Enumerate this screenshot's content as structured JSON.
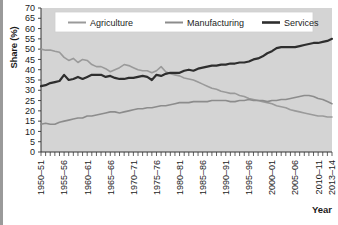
{
  "chart_data": {
    "type": "line",
    "title": "",
    "xlabel": "Year",
    "ylabel": "Share (%)",
    "ylim": [
      0,
      70
    ],
    "ytick_step": 5,
    "yticks": [
      0,
      5,
      10,
      15,
      20,
      25,
      30,
      35,
      40,
      45,
      50,
      55,
      60,
      65,
      70
    ],
    "grid": false,
    "legend_position": "top-center",
    "x_tick_labels": [
      "1950–51",
      "1955–56",
      "1960–61",
      "1965–66",
      "1970–71",
      "1975–76",
      "1980–81",
      "1985–86",
      "1990–91",
      "1995–96",
      "2000–01",
      "2005–06",
      "2010–11",
      "2013–14"
    ],
    "x_tick_index": [
      0,
      5,
      10,
      15,
      20,
      25,
      30,
      35,
      40,
      45,
      50,
      55,
      60,
      63
    ],
    "x": [
      "1950-51",
      "1951-52",
      "1952-53",
      "1953-54",
      "1954-55",
      "1955-56",
      "1956-57",
      "1957-58",
      "1958-59",
      "1959-60",
      "1960-61",
      "1961-62",
      "1962-63",
      "1963-64",
      "1964-65",
      "1965-66",
      "1966-67",
      "1967-68",
      "1968-69",
      "1969-70",
      "1970-71",
      "1971-72",
      "1972-73",
      "1973-74",
      "1974-75",
      "1975-76",
      "1976-77",
      "1977-78",
      "1978-79",
      "1979-80",
      "1980-81",
      "1981-82",
      "1982-83",
      "1983-84",
      "1984-85",
      "1985-86",
      "1986-87",
      "1987-88",
      "1988-89",
      "1989-90",
      "1990-91",
      "1991-92",
      "1992-93",
      "1993-94",
      "1994-95",
      "1995-96",
      "1996-97",
      "1997-98",
      "1998-99",
      "1999-00",
      "2000-01",
      "2001-02",
      "2002-03",
      "2003-04",
      "2004-05",
      "2005-06",
      "2006-07",
      "2007-08",
      "2008-09",
      "2009-10",
      "2010-11",
      "2011-12",
      "2012-13",
      "2013-14"
    ],
    "series": [
      {
        "name": "Agriculture",
        "color": "#9a9a9a",
        "width": 1.6,
        "values": [
          50.0,
          49.5,
          49.6,
          49.0,
          48.5,
          46.0,
          44.5,
          45.5,
          43.5,
          45.0,
          44.5,
          42.5,
          41.5,
          41.5,
          40.5,
          39.0,
          40.0,
          41.0,
          42.5,
          42.0,
          41.0,
          40.0,
          39.5,
          39.5,
          38.5,
          39.5,
          41.5,
          39.0,
          38.0,
          37.5,
          37.0,
          36.0,
          35.5,
          35.0,
          34.0,
          33.0,
          32.0,
          31.0,
          30.5,
          29.5,
          29.0,
          28.5,
          28.5,
          27.5,
          27.0,
          26.0,
          25.5,
          25.0,
          24.5,
          24.0,
          23.5,
          22.5,
          22.0,
          21.5,
          20.5,
          20.0,
          19.5,
          19.0,
          18.5,
          18.0,
          17.5,
          17.5,
          17.0,
          17.0
        ]
      },
      {
        "name": "Manufacturing",
        "color": "#8c8c8c",
        "width": 1.6,
        "values": [
          13.5,
          14.0,
          13.5,
          13.5,
          14.5,
          15.0,
          15.5,
          16.0,
          16.5,
          16.5,
          17.5,
          17.5,
          18.0,
          18.5,
          19.0,
          19.5,
          19.5,
          19.0,
          19.5,
          20.0,
          20.5,
          21.0,
          21.0,
          21.5,
          21.5,
          22.0,
          22.5,
          22.5,
          23.0,
          23.5,
          24.0,
          24.0,
          24.0,
          24.5,
          24.5,
          24.5,
          24.5,
          25.0,
          25.0,
          25.0,
          25.0,
          24.5,
          24.5,
          25.0,
          25.0,
          25.5,
          25.0,
          25.0,
          25.0,
          24.5,
          25.0,
          25.0,
          25.5,
          25.5,
          26.0,
          26.5,
          27.0,
          27.5,
          27.5,
          27.0,
          26.0,
          25.5,
          24.5,
          23.5
        ]
      },
      {
        "name": "Services",
        "color": "#2e2e2e",
        "width": 2.2,
        "values": [
          32.0,
          32.5,
          33.5,
          34.0,
          34.5,
          37.5,
          35.0,
          35.5,
          36.5,
          35.5,
          36.5,
          37.5,
          37.5,
          37.5,
          36.5,
          37.0,
          36.0,
          35.5,
          35.5,
          36.0,
          36.0,
          36.5,
          37.0,
          36.5,
          35.0,
          37.5,
          37.0,
          38.0,
          38.5,
          38.5,
          38.5,
          39.5,
          40.0,
          39.5,
          40.5,
          41.0,
          41.5,
          42.0,
          42.0,
          42.5,
          42.5,
          43.0,
          43.0,
          43.5,
          43.5,
          44.0,
          45.0,
          45.5,
          46.5,
          48.0,
          49.0,
          50.5,
          51.0,
          51.0,
          51.0,
          51.0,
          51.5,
          52.0,
          52.5,
          53.0,
          53.0,
          53.5,
          54.0,
          55.0
        ]
      }
    ]
  },
  "legend": {
    "items": [
      {
        "label": "Agriculture"
      },
      {
        "label": "Manufacturing"
      },
      {
        "label": "Services"
      }
    ]
  },
  "axes": {
    "y_title": "Share (%)",
    "x_title": "Year"
  }
}
